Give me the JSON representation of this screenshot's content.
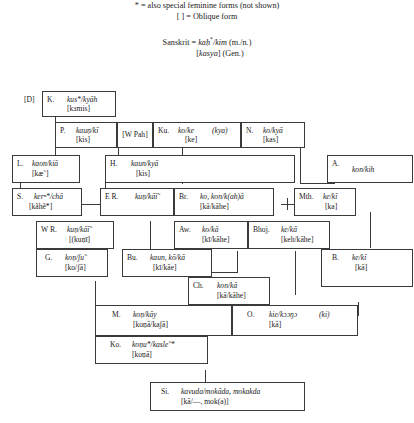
{
  "legend": {
    "line1": "* = also special feminine forms (not shown)",
    "line2": "[ ] = Oblique form",
    "sanskrit_line1": "Sanskrit = kaḥ*/kim (m./n.)",
    "sanskrit_line2": "[kasya] (Gen.)"
  },
  "diagram": {
    "type": "tree",
    "root_tag": "[D]",
    "nodes": [
      {
        "id": "K",
        "abbr": "K.",
        "form": "kus*/kyāh",
        "oblique": "[kɜmis]"
      },
      {
        "id": "P",
        "abbr": "P.",
        "form": "kauṇ/kī",
        "oblique": "[kis]"
      },
      {
        "id": "WPah",
        "abbr": "[W Pah]",
        "form": "",
        "oblique": ""
      },
      {
        "id": "Ku",
        "abbr": "Ku.",
        "form": "ko/ke",
        "paren": "(kya)",
        "oblique": "[ke]"
      },
      {
        "id": "N",
        "abbr": "N.",
        "form": "ko/kyā",
        "oblique": "[kas]"
      },
      {
        "id": "L",
        "abbr": "L.",
        "form": "kaon/kiā",
        "oblique": "[kæ˜]"
      },
      {
        "id": "H",
        "abbr": "H.",
        "form": "kaun/kyā",
        "oblique": "[kis]"
      },
      {
        "id": "A",
        "abbr": "A.",
        "form": "kon/kih",
        "oblique": ""
      },
      {
        "id": "S",
        "abbr": "S.",
        "form": "kerⁿ*/chā",
        "oblique": "[kãhẽ*]"
      },
      {
        "id": "ER",
        "abbr": "E R.",
        "form": "kuṇ/kāī˜",
        "oblique": ""
      },
      {
        "id": "Br",
        "abbr": "Br.",
        "form": "ko, kon/k(ah)ā",
        "oblique": "[kā/kāhe]"
      },
      {
        "id": "Mth",
        "abbr": "Mth.",
        "form": "ke/kī",
        "oblique": "[ka]"
      },
      {
        "id": "WR",
        "abbr": "W R.",
        "form": "kuṇ/kāī˜",
        "oblique": "[(kuṇī]"
      },
      {
        "id": "Aw",
        "abbr": "Aw.",
        "form": "ko/kā",
        "oblique": "[kī/kāhe]"
      },
      {
        "id": "Bhoj",
        "abbr": "Bhoj.",
        "form": "ke/kā",
        "oblique": "[keh/kāhe]"
      },
      {
        "id": "G",
        "abbr": "G.",
        "form": "koṇ/ʃu˜",
        "oblique": "[ko/ʃā]"
      },
      {
        "id": "Bu",
        "abbr": "Bu.",
        "form": "kaun, kō/kā",
        "oblique": "[kī/kāe]"
      },
      {
        "id": "B",
        "abbr": "B.",
        "form": "ke/kī",
        "oblique": "[kā]"
      },
      {
        "id": "Ch",
        "abbr": "Ch.",
        "form": "kon/kā",
        "oblique": "[kā/kāhe]"
      },
      {
        "id": "M",
        "abbr": "M.",
        "form": "koṇ/kāy",
        "oblique": "[koṇā/kaʃā]"
      },
      {
        "id": "O",
        "abbr": "O.",
        "form": "kie/kɔɔŋɔ",
        "paren": "(ki)",
        "oblique": "[kā]"
      },
      {
        "id": "Ko",
        "abbr": "Ko.",
        "form": "koṇu*/kasle˜*",
        "oblique": "[koṇā]"
      },
      {
        "id": "Si",
        "abbr": "Si.",
        "form": "kavuda/mokāda, mokakda",
        "oblique": "[kā/—, mok(a)]"
      }
    ]
  }
}
